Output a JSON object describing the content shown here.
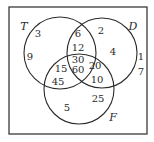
{
  "diagram": {
    "type": "venn-3-set",
    "sets": [
      {
        "id": "T",
        "label": "T"
      },
      {
        "id": "D",
        "label": "D"
      },
      {
        "id": "F",
        "label": "F"
      }
    ],
    "regions": {
      "T_only_top": "3",
      "T_only_left": "9",
      "T_and_D_only_top": "6",
      "T_and_D_only_bottom": "12",
      "all_three_top": "30",
      "all_three_bottom": "60",
      "T_and_F_only_top": "15",
      "T_and_F_only_bottom": "45",
      "D_only_top": "2",
      "D_only_right": "4",
      "D_and_F_only_top": "20",
      "D_and_F_only_bottom": "10",
      "F_only_left": "5",
      "F_only_right": "25",
      "outside_top": "1",
      "outside_bottom": "7"
    }
  }
}
